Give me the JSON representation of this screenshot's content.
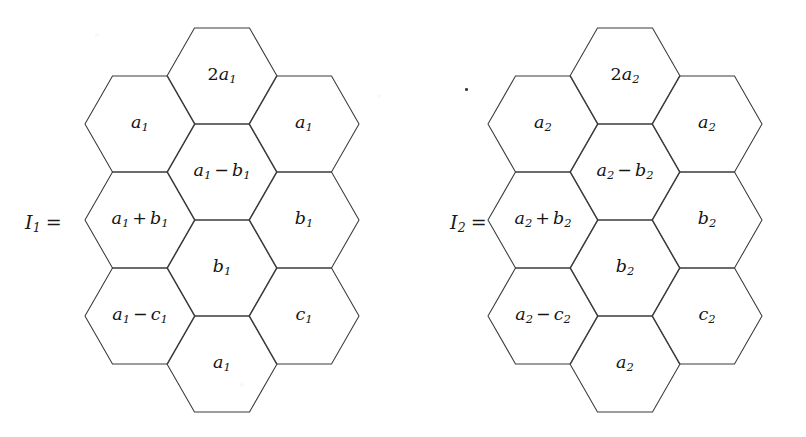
{
  "canvas": {
    "width": 806,
    "height": 437,
    "background": "#ffffff",
    "stroke_color": "#3a3a3a"
  },
  "figures": [
    {
      "id": "I1",
      "origin_x": 0,
      "equation_label": {
        "symbol": "I",
        "subscript": "1",
        "equals": "=",
        "text": "I₁ =",
        "x": 25,
        "y": 222
      },
      "hex": {
        "half_width": 55,
        "half_height": 48,
        "flat_half": 27.5
      },
      "cells": [
        {
          "name": "hex-col1-row1",
          "cx": 140,
          "cy": 124,
          "label": "a₁",
          "base": "a",
          "sub": "1",
          "coeff": "",
          "op": ""
        },
        {
          "name": "hex-col1-row2",
          "cx": 140,
          "cy": 220,
          "label": "a₁ + b₁",
          "base": "a",
          "sub": "1",
          "coeff": "",
          "op": "+",
          "base2": "b",
          "sub2": "1"
        },
        {
          "name": "hex-col1-row3",
          "cx": 140,
          "cy": 316,
          "label": "a₁ − c₁",
          "base": "a",
          "sub": "1",
          "coeff": "",
          "op": "−",
          "base2": "c",
          "sub2": "1"
        },
        {
          "name": "hex-col2-row1",
          "cx": 222,
          "cy": 76,
          "label": "2a₁",
          "base": "a",
          "sub": "1",
          "coeff": "2",
          "op": ""
        },
        {
          "name": "hex-col2-row2",
          "cx": 222,
          "cy": 172,
          "label": "a₁ − b₁",
          "base": "a",
          "sub": "1",
          "coeff": "",
          "op": "−",
          "base2": "b",
          "sub2": "1"
        },
        {
          "name": "hex-col2-row3",
          "cx": 222,
          "cy": 268,
          "label": "b₁",
          "base": "b",
          "sub": "1",
          "coeff": "",
          "op": ""
        },
        {
          "name": "hex-col2-row4",
          "cx": 222,
          "cy": 364,
          "label": "a₁",
          "base": "a",
          "sub": "1",
          "coeff": "",
          "op": ""
        },
        {
          "name": "hex-col3-row1",
          "cx": 304,
          "cy": 124,
          "label": "a₁",
          "base": "a",
          "sub": "1",
          "coeff": "",
          "op": ""
        },
        {
          "name": "hex-col3-row2",
          "cx": 304,
          "cy": 220,
          "label": "b₁",
          "base": "b",
          "sub": "1",
          "coeff": "",
          "op": ""
        },
        {
          "name": "hex-col3-row3",
          "cx": 304,
          "cy": 316,
          "label": "c₁",
          "base": "c",
          "sub": "1",
          "coeff": "",
          "op": ""
        }
      ]
    },
    {
      "id": "I2",
      "origin_x": 403,
      "equation_label": {
        "symbol": "I",
        "subscript": "2",
        "equals": "=",
        "text": "I₂ =",
        "x": 450,
        "y": 222
      },
      "hex": {
        "half_width": 55,
        "half_height": 48,
        "flat_half": 27.5
      },
      "cells": [
        {
          "name": "hex-col1-row1",
          "cx": 140,
          "cy": 124,
          "label": "a₂",
          "base": "a",
          "sub": "2",
          "coeff": "",
          "op": ""
        },
        {
          "name": "hex-col1-row2",
          "cx": 140,
          "cy": 220,
          "label": "a₂ + b₂",
          "base": "a",
          "sub": "2",
          "coeff": "",
          "op": "+",
          "base2": "b",
          "sub2": "2"
        },
        {
          "name": "hex-col1-row3",
          "cx": 140,
          "cy": 316,
          "label": "a₂ − c₂",
          "base": "a",
          "sub": "2",
          "coeff": "",
          "op": "−",
          "base2": "c",
          "sub2": "2"
        },
        {
          "name": "hex-col2-row1",
          "cx": 222,
          "cy": 76,
          "label": "2a₂",
          "base": "a",
          "sub": "2",
          "coeff": "2",
          "op": ""
        },
        {
          "name": "hex-col2-row2",
          "cx": 222,
          "cy": 172,
          "label": "a₂ − b₂",
          "base": "a",
          "sub": "2",
          "coeff": "",
          "op": "−",
          "base2": "b",
          "sub2": "2"
        },
        {
          "name": "hex-col2-row3",
          "cx": 222,
          "cy": 268,
          "label": "b₂",
          "base": "b",
          "sub": "2",
          "coeff": "",
          "op": ""
        },
        {
          "name": "hex-col2-row4",
          "cx": 222,
          "cy": 364,
          "label": "a₂",
          "base": "a",
          "sub": "2",
          "coeff": "",
          "op": ""
        },
        {
          "name": "hex-col3-row1",
          "cx": 304,
          "cy": 124,
          "label": "a₂",
          "base": "a",
          "sub": "2",
          "coeff": "",
          "op": ""
        },
        {
          "name": "hex-col3-row2",
          "cx": 304,
          "cy": 220,
          "label": "b₂",
          "base": "b",
          "sub": "2",
          "coeff": "",
          "op": ""
        },
        {
          "name": "hex-col3-row3",
          "cx": 304,
          "cy": 316,
          "label": "c₂",
          "base": "c",
          "sub": "2",
          "coeff": "",
          "op": ""
        }
      ]
    }
  ],
  "stray_period": {
    "x": 465,
    "y": 88,
    "label": "."
  }
}
